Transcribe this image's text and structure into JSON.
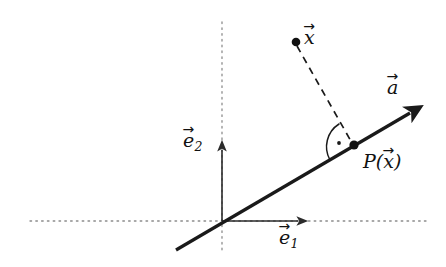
{
  "figure": {
    "type": "geometry-diagram",
    "background_color": "#ffffff",
    "width": 446,
    "height": 267,
    "colors": {
      "ink": "#111111",
      "line_thick": "#1a1a1a",
      "axis": "#2b2b2b",
      "dotted_guide": "#8c8c8c",
      "dashed": "#1a1a1a"
    },
    "labels": {
      "x": {
        "symbol": "x",
        "accent": "vector-arrow",
        "text": "x⃗"
      },
      "a": {
        "symbol": "a",
        "accent": "vector-arrow",
        "text": "a⃗"
      },
      "projection": {
        "function": "P",
        "open_paren": "(",
        "symbol": "x",
        "accent": "vector-arrow",
        "close_paren": ")"
      },
      "e1": {
        "symbol": "e",
        "subscript": "1",
        "accent": "vector-arrow"
      },
      "e2": {
        "symbol": "e",
        "subscript": "2",
        "accent": "vector-arrow"
      }
    },
    "points": {
      "origin": {
        "x": 222,
        "y": 221
      },
      "x_point": {
        "x": 296,
        "y": 42
      },
      "projection_point": {
        "x": 354,
        "y": 145
      }
    },
    "elements": {
      "span_line": {
        "from": {
          "x": 176,
          "y": 250
        },
        "to": {
          "x": 415,
          "y": 110
        },
        "arrowhead": "end",
        "stroke_width": 3.2
      },
      "dashed_segment": {
        "from": {
          "x": 296,
          "y": 42
        },
        "to": {
          "x": 354,
          "y": 145
        },
        "dash": "7 5"
      },
      "e1_axis": {
        "from": {
          "x": 222,
          "y": 221
        },
        "to": {
          "x": 301,
          "y": 221
        },
        "arrowhead": "end"
      },
      "e2_axis": {
        "from": {
          "x": 222,
          "y": 221
        },
        "to": {
          "x": 222,
          "y": 147
        },
        "arrowhead": "end"
      },
      "horizontal_guide": {
        "from": {
          "x": 30,
          "y": 221
        },
        "to": {
          "x": 427,
          "y": 221
        },
        "style": "dotted"
      },
      "vertical_guide": {
        "from": {
          "x": 222,
          "y": 22
        },
        "to": {
          "x": 222,
          "y": 251
        },
        "style": "dotted"
      },
      "right_angle_marker": {
        "center": {
          "x": 354,
          "y": 145
        },
        "radius": 27,
        "dot": true,
        "label": "right angle (90°)"
      }
    }
  }
}
